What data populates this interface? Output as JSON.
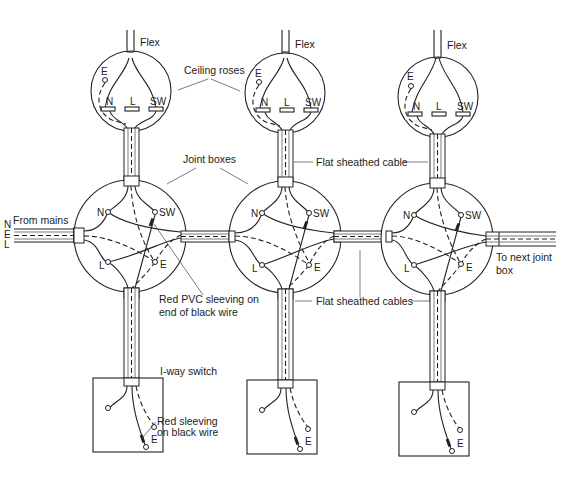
{
  "diagram": {
    "labels": {
      "flex": "Flex",
      "ceiling_roses": "Ceiling roses",
      "joint_boxes": "Joint boxes",
      "flat_sheathed_cable": "Flat sheathed cable",
      "flat_sheathed_cables": "Flat sheathed cables",
      "from_mains": "From mains",
      "to_next_line1": "To next joint",
      "to_next_line2": "box",
      "red_pvc_line1": "Red PVC sleeving on",
      "red_pvc_line2": "end of black wire",
      "one_way_switch": "I-way switch",
      "red_sleeving_line1": "Red sleeving",
      "red_sleeving_line2": "on black wire"
    },
    "mains_conductors": [
      "N",
      "E",
      "L"
    ],
    "terminals": {
      "rose": [
        "E",
        "N",
        "L",
        "SW"
      ],
      "joint_box": [
        "N",
        "SW",
        "L",
        "E"
      ],
      "switch": [
        "E"
      ]
    },
    "units": [
      {
        "name": "unit-1",
        "cx": 130
      },
      {
        "name": "unit-2",
        "cx": 285
      },
      {
        "name": "unit-3",
        "cx": 437
      }
    ]
  }
}
